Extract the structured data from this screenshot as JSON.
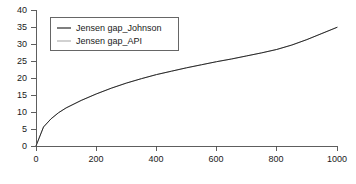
{
  "chart_data": {
    "type": "line",
    "title": "",
    "xlabel": "",
    "ylabel": "",
    "xlim": [
      0,
      1000
    ],
    "ylim": [
      0,
      40
    ],
    "grid": false,
    "legend_position": "upper-left",
    "xticks": [
      0,
      200,
      400,
      600,
      800,
      1000
    ],
    "yticks": [
      0,
      5,
      10,
      15,
      20,
      25,
      30,
      35,
      40
    ],
    "xtick_labels": [
      "0",
      "200",
      "400",
      "600",
      "800",
      "1000"
    ],
    "ytick_labels": [
      "0",
      "5",
      "10",
      "15",
      "20",
      "25",
      "30",
      "35",
      "40"
    ],
    "x": [
      0,
      25,
      50,
      75,
      100,
      150,
      200,
      250,
      300,
      350,
      400,
      450,
      500,
      550,
      600,
      650,
      700,
      750,
      800,
      850,
      900,
      950,
      1000
    ],
    "series": [
      {
        "name": "Jensen gap_Johnson",
        "color": "#2b2b2b",
        "linewidth": 1.0,
        "values": [
          0.0,
          5.6,
          8.0,
          9.8,
          11.2,
          13.4,
          15.3,
          17.0,
          18.5,
          19.8,
          21.0,
          22.0,
          23.0,
          23.9,
          24.8,
          25.6,
          26.5,
          27.4,
          28.4,
          29.7,
          31.3,
          33.1,
          34.9
        ]
      },
      {
        "name": "Jensen gap_API",
        "color": "#b3b3b3",
        "linewidth": 1.0,
        "values": [
          0.0,
          5.6,
          8.0,
          9.8,
          11.2,
          13.4,
          15.3,
          17.0,
          18.5,
          19.8,
          21.0,
          22.0,
          23.0,
          23.9,
          24.8,
          25.6,
          26.5,
          27.4,
          28.4,
          29.7,
          31.3,
          33.1,
          34.9
        ]
      }
    ]
  },
  "legend": {
    "entries": [
      {
        "label": "Jensen gap_Johnson",
        "color": "#2b2b2b"
      },
      {
        "label": "Jensen gap_API",
        "color": "#b3b3b3"
      }
    ]
  },
  "axes": {
    "y_labels": [
      "40",
      "35",
      "30",
      "25",
      "20",
      "15",
      "10",
      "5",
      "0"
    ],
    "x_labels": [
      "0",
      "200",
      "400",
      "600",
      "800",
      "1000"
    ]
  },
  "colors": {
    "background": "#ffffff",
    "axis": "#4d4d4d",
    "text": "#1a1a1a",
    "series_johnson": "#2b2b2b",
    "series_api": "#b3b3b3",
    "legend_border": "#555555"
  }
}
